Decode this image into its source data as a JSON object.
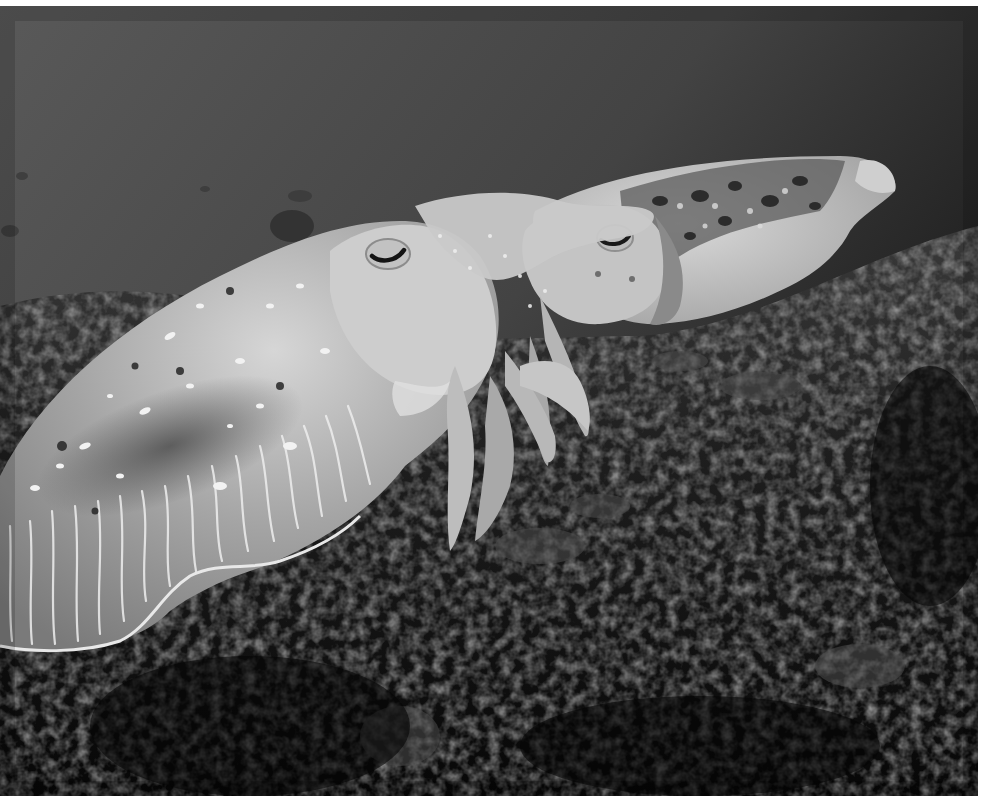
{
  "image": {
    "subject": "two cuttlefish swimming over a dark reef",
    "mode": "grayscale",
    "frame": {
      "x": 0,
      "y": 6,
      "width": 978,
      "height": 790,
      "border_color": "#ffffff"
    }
  },
  "palette": {
    "water_top": "#555555",
    "water_mid": "#3d3d3d",
    "water_right": "#1e1e1e",
    "reef_dark": "#0c0c0c",
    "reef_mid": "#2a2a2a",
    "reef_light": "#5a5a5a",
    "body_light": "#d8d8d8",
    "body_mid": "#a9a9a9",
    "body_shadow": "#6f6f6f",
    "fin_edge": "#e6e6e6",
    "spot_white": "#f4f4f4",
    "spot_dark": "#2b2b2b"
  }
}
